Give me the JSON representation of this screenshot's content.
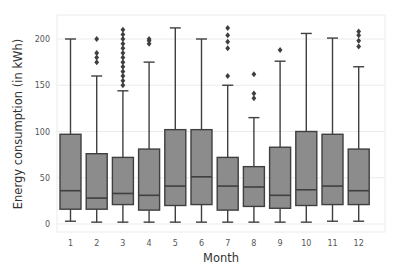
{
  "chart_data": {
    "type": "box",
    "title": "",
    "xlabel": "Month",
    "ylabel": "Energy consumption (in kWh)",
    "ylim": [
      -8,
      218
    ],
    "yticks": [
      0,
      50,
      100,
      150,
      200
    ],
    "grid": true,
    "categories": [
      "1",
      "2",
      "3",
      "4",
      "5",
      "6",
      "7",
      "8",
      "9",
      "10",
      "11",
      "12"
    ],
    "boxes": [
      {
        "month": "1",
        "whisker_low": 3,
        "q1": 16,
        "median": 36,
        "q3": 97,
        "whisker_high": 200,
        "outliers": []
      },
      {
        "month": "2",
        "whisker_low": 2,
        "q1": 16,
        "median": 28,
        "q3": 76,
        "whisker_high": 160,
        "outliers": [
          175,
          180,
          185,
          200
        ]
      },
      {
        "month": "3",
        "whisker_low": 2,
        "q1": 21,
        "median": 33,
        "q3": 72,
        "whisker_high": 144,
        "outliers": [
          150,
          155,
          160,
          165,
          170,
          175,
          180,
          185,
          190,
          195,
          200,
          205,
          210
        ]
      },
      {
        "month": "4",
        "whisker_low": 2,
        "q1": 15,
        "median": 31,
        "q3": 81,
        "whisker_high": 175,
        "outliers": [
          195,
          198,
          200
        ]
      },
      {
        "month": "5",
        "whisker_low": 2,
        "q1": 20,
        "median": 41,
        "q3": 102,
        "whisker_high": 212,
        "outliers": []
      },
      {
        "month": "6",
        "whisker_low": 2,
        "q1": 21,
        "median": 51,
        "q3": 102,
        "whisker_high": 200,
        "outliers": []
      },
      {
        "month": "7",
        "whisker_low": 2,
        "q1": 15,
        "median": 41,
        "q3": 72,
        "whisker_high": 150,
        "outliers": [
          160,
          190,
          197,
          204,
          212
        ]
      },
      {
        "month": "8",
        "whisker_low": 2,
        "q1": 19,
        "median": 40,
        "q3": 62,
        "whisker_high": 115,
        "outliers": [
          136,
          141,
          162
        ]
      },
      {
        "month": "9",
        "whisker_low": 2,
        "q1": 17,
        "median": 31,
        "q3": 83,
        "whisker_high": 176,
        "outliers": [
          188
        ]
      },
      {
        "month": "10",
        "whisker_low": 2,
        "q1": 20,
        "median": 37,
        "q3": 100,
        "whisker_high": 206,
        "outliers": []
      },
      {
        "month": "11",
        "whisker_low": 3,
        "q1": 21,
        "median": 41,
        "q3": 97,
        "whisker_high": 201,
        "outliers": []
      },
      {
        "month": "12",
        "whisker_low": 3,
        "q1": 21,
        "median": 36,
        "q3": 81,
        "whisker_high": 170,
        "outliers": [
          192,
          198,
          204,
          208
        ]
      }
    ],
    "colors": {
      "box_fill": "#8c8c8c",
      "box_edge": "#3f3f3f",
      "grid": "#ebebeb",
      "outlier": "#3f3f3f"
    }
  }
}
